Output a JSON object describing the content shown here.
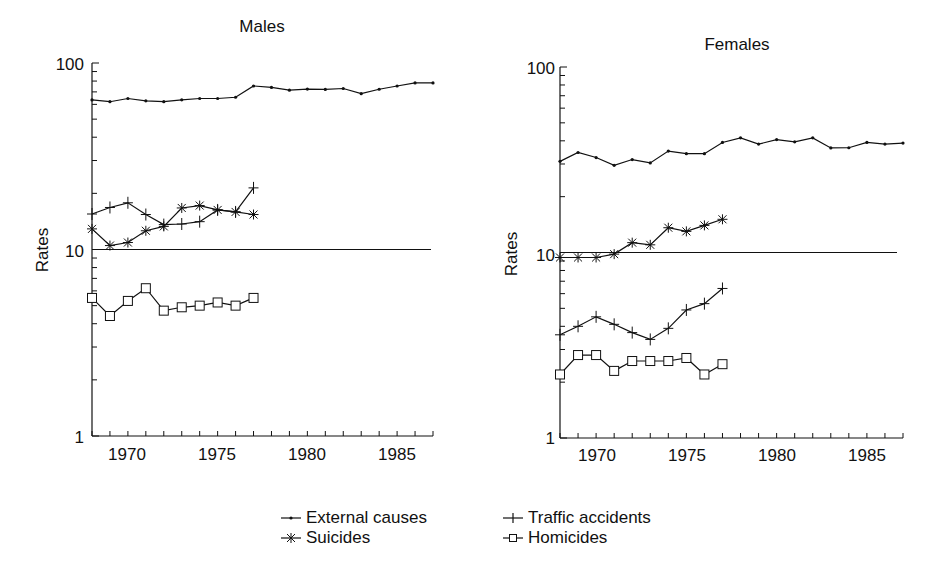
{
  "figure": {
    "panels": [
      "Males",
      "Females"
    ],
    "ylabel": "Rates",
    "ytick_labels": [
      "100",
      "10",
      "1"
    ],
    "xtick_labels": [
      "1970",
      "1975",
      "1980",
      "1985"
    ]
  },
  "legend": {
    "items": [
      {
        "label": "External causes",
        "marker": "dot"
      },
      {
        "label": "Traffic accidents",
        "marker": "plus"
      },
      {
        "label": "Suicides",
        "marker": "asterisk"
      },
      {
        "label": "Homicides",
        "marker": "square"
      }
    ]
  },
  "chart_data": [
    {
      "type": "line",
      "title": "Males",
      "xlabel": "",
      "ylabel": "Rates",
      "yscale": "log",
      "ylim": [
        1,
        100
      ],
      "xlim": [
        1968,
        1987
      ],
      "yticks": [
        1,
        10,
        100
      ],
      "xticks": [
        1970,
        1975,
        1980,
        1985
      ],
      "reference_line": 10,
      "grid": false,
      "legend_position": "bottom-center",
      "series": [
        {
          "name": "External causes",
          "marker": "dot",
          "x": [
            1968,
            1969,
            1970,
            1971,
            1972,
            1973,
            1974,
            1975,
            1976,
            1977,
            1978,
            1979,
            1980,
            1981,
            1982,
            1983,
            1984,
            1985,
            1986,
            1987
          ],
          "values": [
            63.4,
            62.0,
            64.5,
            62.7,
            62.0,
            63.5,
            64.5,
            64.5,
            65.5,
            75.3,
            74.0,
            71.5,
            72.5,
            72.2,
            73.0,
            68.5,
            72.3,
            75.3,
            78.2,
            78.2
          ]
        },
        {
          "name": "Traffic accidents",
          "marker": "plus",
          "x": [
            1968,
            1969,
            1970,
            1971,
            1972,
            1973,
            1974,
            1975,
            1976,
            1977
          ],
          "values": [
            15.5,
            16.8,
            17.8,
            15.4,
            13.6,
            13.7,
            14.1,
            16.3,
            15.9,
            21.4
          ]
        },
        {
          "name": "Suicides",
          "marker": "asterisk",
          "x": [
            1968,
            1969,
            1970,
            1971,
            1972,
            1973,
            1974,
            1975,
            1976,
            1977
          ],
          "values": [
            12.9,
            10.5,
            10.9,
            12.6,
            13.3,
            16.7,
            17.2,
            16.3,
            15.9,
            15.4
          ]
        },
        {
          "name": "Homicides",
          "marker": "square",
          "x": [
            1968,
            1969,
            1970,
            1971,
            1972,
            1973,
            1974,
            1975,
            1976,
            1977
          ],
          "values": [
            5.5,
            4.4,
            5.3,
            6.2,
            4.7,
            4.9,
            5.0,
            5.2,
            5.0,
            5.5
          ]
        }
      ]
    },
    {
      "type": "line",
      "title": "Females",
      "xlabel": "",
      "ylabel": "Rates",
      "yscale": "log",
      "ylim": [
        1,
        100
      ],
      "xlim": [
        1968,
        1987
      ],
      "yticks": [
        1,
        10,
        100
      ],
      "xticks": [
        1970,
        1975,
        1980,
        1985
      ],
      "reference_line": 10,
      "grid": false,
      "legend_position": "bottom-center",
      "series": [
        {
          "name": "External causes",
          "marker": "dot",
          "x": [
            1968,
            1969,
            1970,
            1971,
            1972,
            1973,
            1974,
            1975,
            1976,
            1977,
            1978,
            1979,
            1980,
            1981,
            1982,
            1983,
            1984,
            1985,
            1986,
            1987
          ],
          "values": [
            31.0,
            34.6,
            32.5,
            29.5,
            31.7,
            30.4,
            35.2,
            34.1,
            34.1,
            39.2,
            41.5,
            38.4,
            40.6,
            39.5,
            41.5,
            36.6,
            36.7,
            39.2,
            38.4,
            38.9
          ]
        },
        {
          "name": "Traffic accidents",
          "marker": "plus",
          "x": [
            1968,
            1969,
            1970,
            1971,
            1972,
            1973,
            1974,
            1975,
            1976,
            1977
          ],
          "values": [
            3.6,
            4.0,
            4.5,
            4.1,
            3.7,
            3.4,
            3.9,
            4.9,
            5.3,
            6.4
          ]
        },
        {
          "name": "Suicides",
          "marker": "asterisk",
          "x": [
            1968,
            1969,
            1970,
            1971,
            1972,
            1973,
            1974,
            1975,
            1976,
            1977
          ],
          "values": [
            9.4,
            9.4,
            9.4,
            9.8,
            11.3,
            11.0,
            13.6,
            13.0,
            14.0,
            15.1
          ]
        },
        {
          "name": "Homicides",
          "marker": "square",
          "x": [
            1968,
            1969,
            1970,
            1971,
            1972,
            1973,
            1974,
            1975,
            1976,
            1977
          ],
          "values": [
            2.2,
            2.8,
            2.8,
            2.3,
            2.6,
            2.6,
            2.6,
            2.7,
            2.2,
            2.5
          ]
        }
      ]
    }
  ]
}
